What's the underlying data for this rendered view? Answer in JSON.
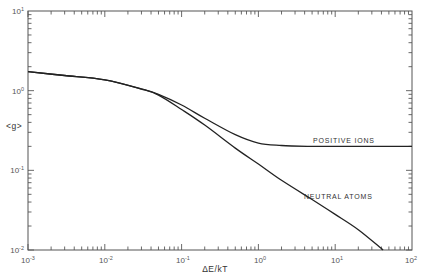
{
  "chart_data": {
    "type": "line",
    "title": "",
    "xlabel": "ΔE/kT",
    "ylabel": "<g>",
    "xscale": "log",
    "yscale": "log",
    "xlim": [
      0.001,
      100
    ],
    "ylim": [
      0.01,
      10
    ],
    "grid": false,
    "legend": "none (inline annotations)",
    "x_ticks": [
      "10^-3",
      "10^-2",
      "10^-1",
      "10^0",
      "10^1",
      "10^2"
    ],
    "y_ticks": [
      "10^-2",
      "10^-1",
      "10^0",
      "10^1"
    ],
    "series": [
      {
        "name": "POSITIVE IONS",
        "x": [
          0.001,
          0.003,
          0.01,
          0.03,
          0.05,
          0.1,
          0.2,
          0.5,
          1,
          2,
          5,
          10,
          100
        ],
        "values": [
          1.73,
          1.55,
          1.37,
          1.05,
          0.9,
          0.66,
          0.45,
          0.28,
          0.22,
          0.205,
          0.2,
          0.2,
          0.2
        ]
      },
      {
        "name": "NEUTRAL ATOMS",
        "x": [
          0.001,
          0.003,
          0.01,
          0.03,
          0.05,
          0.1,
          0.2,
          0.5,
          1,
          2,
          5,
          10,
          20,
          42
        ],
        "values": [
          1.73,
          1.55,
          1.37,
          1.05,
          0.88,
          0.58,
          0.37,
          0.19,
          0.12,
          0.075,
          0.043,
          0.028,
          0.018,
          0.01
        ]
      }
    ],
    "annotations": [
      {
        "text": "POSITIVE IONS",
        "x": 5,
        "y": 0.23
      },
      {
        "text": "NEUTRAL ATOMS",
        "x": 5,
        "y": 0.045
      }
    ]
  },
  "labels": {
    "xlabel": "ΔE/kT",
    "ylabel": "<g>",
    "xticks": {
      "m3": "10",
      "m3e": "-3",
      "m2": "10",
      "m2e": "-2",
      "m1": "10",
      "m1e": "-1",
      "z": "10",
      "ze": "0",
      "p1": "10",
      "p1e": "1",
      "p2": "10",
      "p2e": "2"
    },
    "yticks": {
      "m2": "10",
      "m2e": "-2",
      "m1": "10",
      "m1e": "-1",
      "z": "10",
      "ze": "0",
      "p1": "10",
      "p1e": "1"
    },
    "series_pi": "POSITIVE IONS",
    "series_na": "NEUTRAL ATOMS"
  }
}
